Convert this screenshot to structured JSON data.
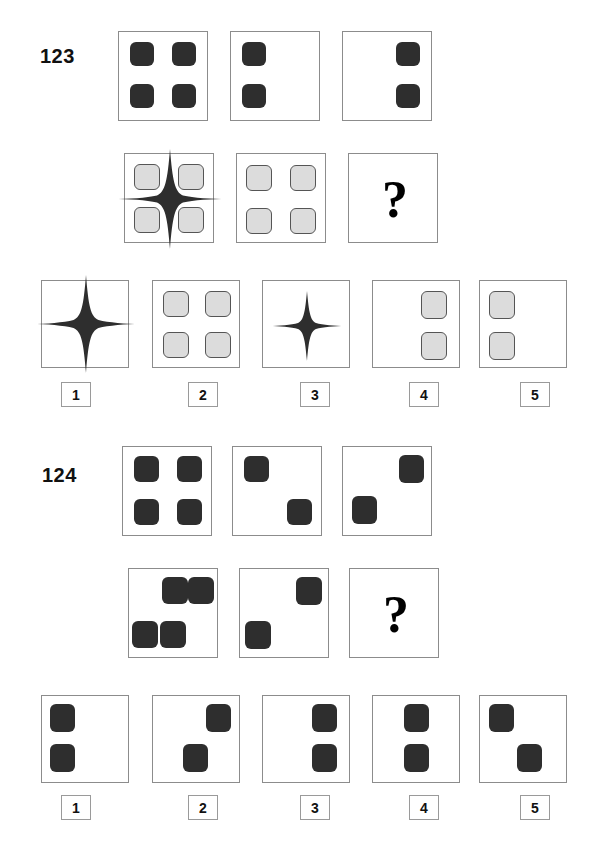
{
  "page": {
    "width": 603,
    "height": 862,
    "background": "#ffffff",
    "type": "nonverbal-matrix-reasoning-test-page"
  },
  "colors": {
    "dark_square": "#2e2e2e",
    "light_square": "#dcdcdc",
    "light_square_border": "#555555",
    "cell_border": "#8c8c8c",
    "option_box_border": "#9a9a9a",
    "text": "#111111",
    "star_fill": "#2e2e2e"
  },
  "items": [
    {
      "id": "item-123",
      "label": "123",
      "matrix": {
        "rows": [
          {
            "row_index": 1,
            "cells": [
              {
                "name": "matrix-cell-r1c1",
                "shapes": [
                  {
                    "kind": "square",
                    "fill": "dark",
                    "pos": "top-left"
                  },
                  {
                    "kind": "square",
                    "fill": "dark",
                    "pos": "top-right"
                  },
                  {
                    "kind": "square",
                    "fill": "dark",
                    "pos": "bottom-left"
                  },
                  {
                    "kind": "square",
                    "fill": "dark",
                    "pos": "bottom-right"
                  }
                ]
              },
              {
                "name": "matrix-cell-r1c2",
                "shapes": [
                  {
                    "kind": "square",
                    "fill": "dark",
                    "pos": "top-left"
                  },
                  {
                    "kind": "square",
                    "fill": "dark",
                    "pos": "bottom-left"
                  }
                ]
              },
              {
                "name": "matrix-cell-r1c3",
                "shapes": [
                  {
                    "kind": "square",
                    "fill": "dark",
                    "pos": "top-right"
                  },
                  {
                    "kind": "square",
                    "fill": "dark",
                    "pos": "bottom-right"
                  }
                ]
              }
            ]
          },
          {
            "row_index": 2,
            "cells": [
              {
                "name": "matrix-cell-r2c1",
                "shapes": [
                  {
                    "kind": "square",
                    "fill": "light",
                    "pos": "top-left"
                  },
                  {
                    "kind": "square",
                    "fill": "light",
                    "pos": "top-right"
                  },
                  {
                    "kind": "square",
                    "fill": "light",
                    "pos": "bottom-left"
                  },
                  {
                    "kind": "square",
                    "fill": "light",
                    "pos": "bottom-right"
                  },
                  {
                    "kind": "star",
                    "size": "large",
                    "pos": "center"
                  }
                ]
              },
              {
                "name": "matrix-cell-r2c2",
                "shapes": [
                  {
                    "kind": "square",
                    "fill": "light",
                    "pos": "top-left"
                  },
                  {
                    "kind": "square",
                    "fill": "light",
                    "pos": "top-right"
                  },
                  {
                    "kind": "square",
                    "fill": "light",
                    "pos": "bottom-left"
                  },
                  {
                    "kind": "square",
                    "fill": "light",
                    "pos": "bottom-right"
                  }
                ]
              },
              {
                "name": "matrix-cell-r2c3-answer",
                "question_mark": "?",
                "shapes": []
              }
            ]
          }
        ]
      },
      "options": [
        {
          "number": "1",
          "name": "option-1",
          "shapes": [
            {
              "kind": "star",
              "size": "large",
              "pos": "center"
            }
          ]
        },
        {
          "number": "2",
          "name": "option-2",
          "shapes": [
            {
              "kind": "square",
              "fill": "light",
              "pos": "top-left"
            },
            {
              "kind": "square",
              "fill": "light",
              "pos": "top-right"
            },
            {
              "kind": "square",
              "fill": "light",
              "pos": "bottom-left"
            },
            {
              "kind": "square",
              "fill": "light",
              "pos": "bottom-right"
            }
          ]
        },
        {
          "number": "3",
          "name": "option-3",
          "shapes": [
            {
              "kind": "star",
              "size": "small",
              "pos": "center"
            }
          ]
        },
        {
          "number": "4",
          "name": "option-4",
          "shapes": [
            {
              "kind": "square",
              "fill": "light",
              "pos": "top-right"
            },
            {
              "kind": "square",
              "fill": "light",
              "pos": "bottom-right"
            }
          ]
        },
        {
          "number": "5",
          "name": "option-5",
          "shapes": [
            {
              "kind": "square",
              "fill": "light",
              "pos": "top-left"
            },
            {
              "kind": "square",
              "fill": "light",
              "pos": "bottom-left"
            }
          ]
        }
      ]
    },
    {
      "id": "item-124",
      "label": "124",
      "matrix": {
        "rows": [
          {
            "row_index": 1,
            "cells": [
              {
                "name": "matrix-cell-r1c1",
                "shapes": [
                  {
                    "kind": "square",
                    "fill": "dark",
                    "pos": "top-left"
                  },
                  {
                    "kind": "square",
                    "fill": "dark",
                    "pos": "top-right"
                  },
                  {
                    "kind": "square",
                    "fill": "dark",
                    "pos": "bottom-left"
                  },
                  {
                    "kind": "square",
                    "fill": "dark",
                    "pos": "bottom-right"
                  }
                ]
              },
              {
                "name": "matrix-cell-r1c2",
                "shapes": [
                  {
                    "kind": "square",
                    "fill": "dark",
                    "pos": "top-left"
                  },
                  {
                    "kind": "square",
                    "fill": "dark",
                    "pos": "bottom-right"
                  }
                ]
              },
              {
                "name": "matrix-cell-r1c3",
                "shapes": [
                  {
                    "kind": "square",
                    "fill": "dark",
                    "pos": "top-right"
                  },
                  {
                    "kind": "square",
                    "fill": "dark",
                    "pos": "bottom-left"
                  }
                ]
              }
            ]
          },
          {
            "row_index": 2,
            "cells": [
              {
                "name": "matrix-cell-r2c1",
                "shapes": [
                  {
                    "kind": "square",
                    "fill": "dark",
                    "pos": "top-mid"
                  },
                  {
                    "kind": "square",
                    "fill": "dark",
                    "pos": "top-right-inner"
                  },
                  {
                    "kind": "square",
                    "fill": "dark",
                    "pos": "bottom-left-edge"
                  },
                  {
                    "kind": "square",
                    "fill": "dark",
                    "pos": "bottom-mid"
                  }
                ]
              },
              {
                "name": "matrix-cell-r2c2",
                "shapes": [
                  {
                    "kind": "square",
                    "fill": "dark",
                    "pos": "top-right-inner"
                  },
                  {
                    "kind": "square",
                    "fill": "dark",
                    "pos": "bottom-left-edge"
                  }
                ]
              },
              {
                "name": "matrix-cell-r2c3-answer",
                "question_mark": "?",
                "shapes": []
              }
            ]
          }
        ]
      },
      "options": [
        {
          "number": "1",
          "name": "option-1",
          "shapes": [
            {
              "kind": "square",
              "fill": "dark",
              "pos": "top-left"
            },
            {
              "kind": "square",
              "fill": "dark",
              "pos": "bottom-left"
            }
          ]
        },
        {
          "number": "2",
          "name": "option-2",
          "shapes": [
            {
              "kind": "square",
              "fill": "dark",
              "pos": "top-right"
            },
            {
              "kind": "square",
              "fill": "dark",
              "pos": "bottom-mid"
            }
          ]
        },
        {
          "number": "3",
          "name": "option-3",
          "shapes": [
            {
              "kind": "square",
              "fill": "dark",
              "pos": "top-right"
            },
            {
              "kind": "square",
              "fill": "dark",
              "pos": "bottom-right"
            }
          ]
        },
        {
          "number": "4",
          "name": "option-4",
          "shapes": [
            {
              "kind": "square",
              "fill": "dark",
              "pos": "top-mid"
            },
            {
              "kind": "square",
              "fill": "dark",
              "pos": "bottom-mid"
            }
          ]
        },
        {
          "number": "5",
          "name": "option-5",
          "shapes": [
            {
              "kind": "square",
              "fill": "dark",
              "pos": "top-left"
            },
            {
              "kind": "square",
              "fill": "dark",
              "pos": "bottom-mid"
            }
          ]
        }
      ]
    }
  ]
}
